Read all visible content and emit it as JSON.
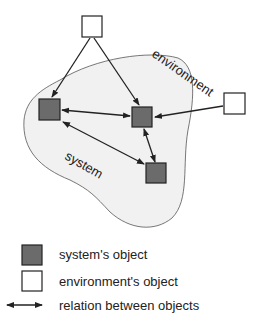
{
  "diagram": {
    "region_labels": {
      "environment": "environment",
      "system": "system"
    },
    "colors": {
      "system_object_fill": "#6b6b6b",
      "environment_object_fill": "#ffffff",
      "system_region_fill": "#f1f1f1",
      "stroke": "#222222"
    },
    "nodes": [
      {
        "id": "env-top",
        "type": "environment"
      },
      {
        "id": "env-right",
        "type": "environment"
      },
      {
        "id": "sys-left",
        "type": "system"
      },
      {
        "id": "sys-center",
        "type": "system"
      },
      {
        "id": "sys-bottom",
        "type": "system"
      }
    ],
    "edges": [
      {
        "from": "env-top",
        "to": "sys-left",
        "type": "directed"
      },
      {
        "from": "env-top",
        "to": "sys-center",
        "type": "directed"
      },
      {
        "from": "env-right",
        "to": "sys-center",
        "type": "directed"
      },
      {
        "from": "sys-left",
        "to": "sys-center",
        "type": "bidirectional"
      },
      {
        "from": "sys-left",
        "to": "sys-bottom",
        "type": "bidirectional"
      },
      {
        "from": "sys-center",
        "to": "sys-bottom",
        "type": "bidirectional"
      }
    ]
  },
  "legend": {
    "items": [
      {
        "icon": "system-object-square",
        "label": "system's object"
      },
      {
        "icon": "environment-object-square",
        "label": "environment's object"
      },
      {
        "icon": "double-arrow",
        "label": "relation between objects"
      }
    ]
  }
}
